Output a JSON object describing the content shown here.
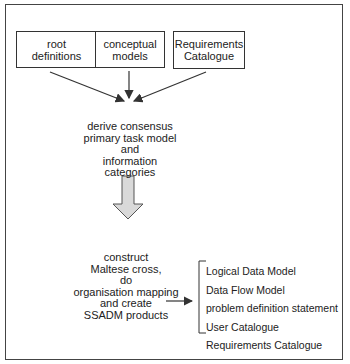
{
  "diagram": {
    "inputs": [
      {
        "label": "root\ndefinitions"
      },
      {
        "label": "conceptual\nmodels"
      },
      {
        "label": "Requirements\nCatalogue"
      }
    ],
    "step1": "derive consensus\nprimary task model\nand\ninformation categories",
    "step2": "construct\nMaltese cross,\ndo\norganisation mapping\nand create\nSSADM products",
    "outputs": [
      "Logical Data Model",
      "Data Flow Model",
      "problem definition statement",
      "User Catalogue",
      "Requirements Catalogue"
    ],
    "colors": {
      "line": "#333333",
      "arrow_fill": "#d9d9d9"
    }
  }
}
